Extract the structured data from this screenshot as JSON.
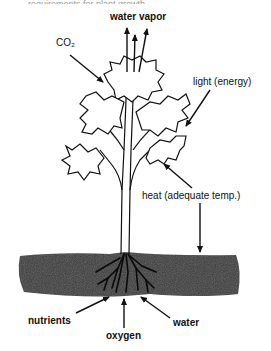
{
  "diagram": {
    "title_fragment": "requirements for plant growth",
    "labels": {
      "water_vapor": "water vapor",
      "co2": "CO₂",
      "light": "light (energy)",
      "heat": "heat (adequate temp.)",
      "nutrients": "nutrients",
      "oxygen": "oxygen",
      "water": "water"
    },
    "colors": {
      "line": "#111111",
      "soil": "#3a3a3a",
      "background": "#ffffff"
    }
  }
}
